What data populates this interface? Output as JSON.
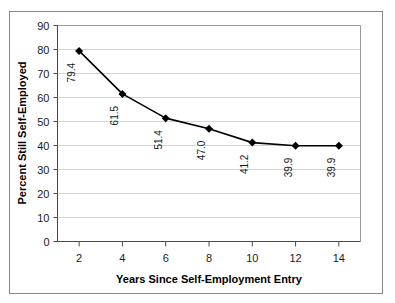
{
  "chart_data": {
    "type": "line",
    "title": "",
    "xlabel": "Years Since Self-Employment Entry",
    "ylabel": "Percent Still Self-Employed",
    "x": [
      2,
      4,
      6,
      8,
      10,
      12,
      14
    ],
    "values": [
      79.4,
      61.5,
      51.4,
      47.0,
      41.2,
      39.9,
      39.9
    ],
    "point_labels": [
      "79.4",
      "61.5",
      "51.4",
      "47.0",
      "41.2",
      "39.9",
      "39.9"
    ],
    "xtick_labels": [
      "2",
      "4",
      "6",
      "8",
      "10",
      "12",
      "14"
    ],
    "ytick_labels": [
      "0",
      "10",
      "20",
      "30",
      "40",
      "50",
      "60",
      "70",
      "80",
      "90"
    ],
    "yticks": [
      0,
      10,
      20,
      30,
      40,
      50,
      60,
      70,
      80,
      90
    ],
    "xlim": [
      1,
      15
    ],
    "ylim": [
      0,
      90
    ],
    "grid": "horizontal",
    "legend": "none",
    "marker": "diamond",
    "series_color": "#000000",
    "grid_color": "#d4d4d4",
    "axis_color": "#7a7a7a",
    "border_color": "#8a8a8a",
    "background_color": "#ffffff",
    "point_label_rotation": -90
  }
}
